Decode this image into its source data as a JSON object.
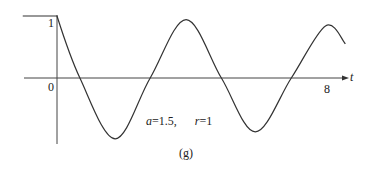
{
  "chart_data": {
    "type": "line",
    "title": "",
    "panel_label": "(g)",
    "annotation": "a=1.5,   r=1",
    "params": {
      "a": 1.5,
      "r": 1
    },
    "xlabel": "t",
    "ylabel": "",
    "x_ticks": [
      {
        "value": 0,
        "label": "0"
      },
      {
        "value": 8,
        "label": "8"
      }
    ],
    "y_ticks": [
      {
        "value": 1,
        "label": "1"
      }
    ],
    "xlim": [
      -1.0,
      8.5
    ],
    "ylim": [
      -1.05,
      1.0
    ],
    "grid": false,
    "legend": null,
    "series": [
      {
        "name": "response",
        "color": "#333333",
        "x": [
          -1.0,
          0.0,
          0.67,
          1.7,
          2.72,
          3.77,
          4.8,
          5.79,
          6.84,
          7.84,
          8.42
        ],
        "y": [
          1.0,
          1.0,
          0.0,
          -0.98,
          0.0,
          0.94,
          0.0,
          -0.87,
          0.0,
          0.84,
          0.55
        ]
      }
    ]
  },
  "labels": {
    "x_axis_name": "t",
    "tick_zero": "0",
    "tick_eight": "8",
    "tick_one": "1",
    "annotation_a": "a",
    "annotation_a_value": "=1.5,",
    "annotation_r": "r",
    "annotation_r_value": "=1",
    "panel": "(g)"
  }
}
